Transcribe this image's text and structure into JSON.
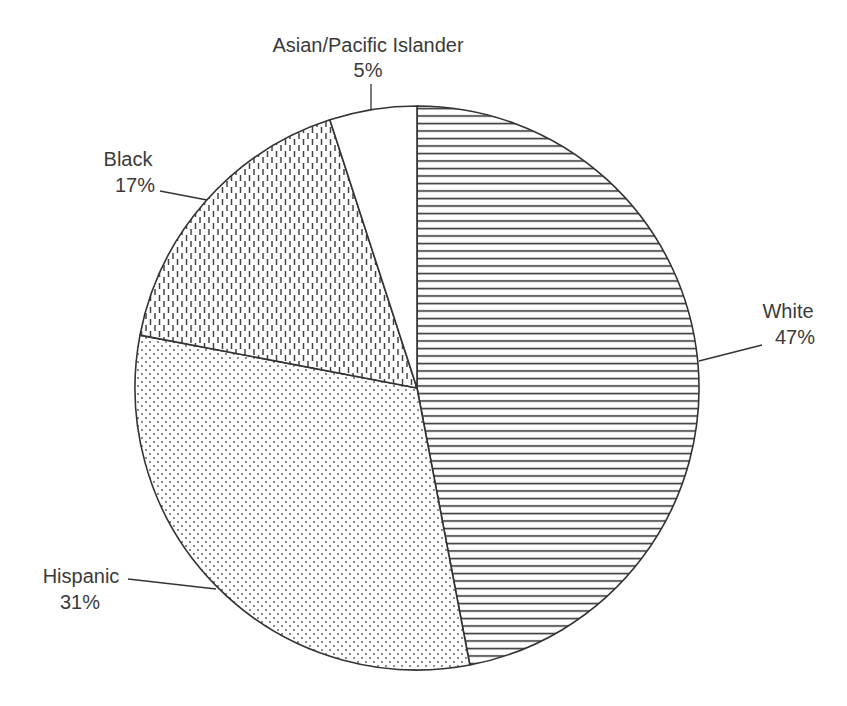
{
  "chart_data": {
    "type": "pie",
    "title": "",
    "start_angle": "12 o'clock",
    "direction": "clockwise",
    "categories": [
      "White",
      "Hispanic",
      "Black",
      "Asian/Pacific Islander"
    ],
    "values": [
      47,
      31,
      17,
      5
    ],
    "unit": "%",
    "labels": [
      {
        "name": "White",
        "value_label": "47%",
        "pattern": "horizontal-lines"
      },
      {
        "name": "Hispanic",
        "value_label": "31%",
        "pattern": "dots"
      },
      {
        "name": "Black",
        "value_label": "17%",
        "pattern": "vertical-dashes"
      },
      {
        "name": "Asian/Pacific Islander",
        "value_label": "5%",
        "pattern": "solid-white"
      }
    ],
    "legend": "none (leader-line labels)",
    "colors": {
      "stroke": "#333333",
      "text": "#3a3a3a",
      "background": "#ffffff"
    }
  },
  "geometry": {
    "cx": 417,
    "cy": 388,
    "r": 282
  }
}
